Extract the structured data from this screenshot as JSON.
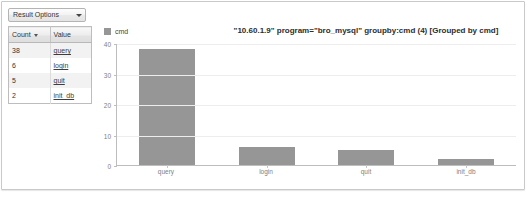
{
  "panel": {
    "result_options_label": "Result Options"
  },
  "results_table": {
    "columns": [
      "Count",
      "Value"
    ],
    "sorted_column": "Count",
    "rows": [
      {
        "count": "38",
        "value": "query"
      },
      {
        "count": "6",
        "value": "login"
      },
      {
        "count": "5",
        "value": "quit"
      },
      {
        "count": "2",
        "value": "init_db"
      }
    ]
  },
  "chart_data": {
    "type": "bar",
    "title": "\"10.60.1.9\" program=\"bro_mysql\" groupby:cmd (4) [Grouped by cmd]",
    "categories": [
      "query",
      "login",
      "quit",
      "init_db"
    ],
    "values": [
      38,
      6,
      5,
      2
    ],
    "series": [
      {
        "name": "cmd",
        "values": [
          38,
          6,
          5,
          2
        ]
      }
    ],
    "legend": [
      "cmd"
    ],
    "legend_position": "top-left",
    "xlabel": "",
    "ylabel": "",
    "ylim": [
      0,
      40
    ],
    "yticks": [
      0,
      10,
      20,
      30,
      40
    ],
    "grid": true,
    "bar_color": "#969696"
  }
}
